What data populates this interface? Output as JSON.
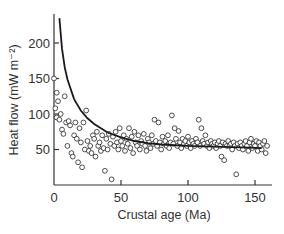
{
  "chart_data": {
    "type": "scatter",
    "title": "",
    "xlabel": "Crustal age (Ma)",
    "ylabel": "Heat flow (mW m⁻²)",
    "xlim": [
      0,
      162
    ],
    "ylim": [
      0,
      240
    ],
    "x_ticks": [
      0,
      50,
      100,
      150
    ],
    "y_ticks": [
      50,
      100,
      150,
      200
    ],
    "grid": false,
    "legend": null,
    "series": [
      {
        "name": "Observed heat flow",
        "style": "open-circle",
        "points": [
          [
            0,
            150
          ],
          [
            1,
            108
          ],
          [
            2,
            130
          ],
          [
            3,
            118
          ],
          [
            2,
            95
          ],
          [
            4,
            92
          ],
          [
            5,
            100
          ],
          [
            6,
            78
          ],
          [
            7,
            72
          ],
          [
            8,
            125
          ],
          [
            9,
            88
          ],
          [
            10,
            55
          ],
          [
            11,
            90
          ],
          [
            12,
            84
          ],
          [
            13,
            45
          ],
          [
            14,
            40
          ],
          [
            15,
            70
          ],
          [
            16,
            88
          ],
          [
            17,
            65
          ],
          [
            18,
            32
          ],
          [
            19,
            80
          ],
          [
            20,
            60
          ],
          [
            21,
            25
          ],
          [
            22,
            88
          ],
          [
            23,
            50
          ],
          [
            24,
            105
          ],
          [
            25,
            62
          ],
          [
            26,
            48
          ],
          [
            27,
            55
          ],
          [
            28,
            45
          ],
          [
            29,
            70
          ],
          [
            30,
            65
          ],
          [
            31,
            40
          ],
          [
            32,
            75
          ],
          [
            33,
            55
          ],
          [
            34,
            60
          ],
          [
            35,
            48
          ],
          [
            36,
            70
          ],
          [
            37,
            52
          ],
          [
            38,
            20
          ],
          [
            39,
            65
          ],
          [
            40,
            50
          ],
          [
            41,
            72
          ],
          [
            42,
            58
          ],
          [
            43,
            8
          ],
          [
            44,
            68
          ],
          [
            45,
            55
          ],
          [
            46,
            75
          ],
          [
            47,
            60
          ],
          [
            48,
            50
          ],
          [
            49,
            80
          ],
          [
            50,
            62
          ],
          [
            51,
            55
          ],
          [
            52,
            70
          ],
          [
            53,
            48
          ],
          [
            54,
            65
          ],
          [
            55,
            58
          ],
          [
            56,
            80
          ],
          [
            57,
            52
          ],
          [
            58,
            68
          ],
          [
            59,
            45
          ],
          [
            60,
            75
          ],
          [
            61,
            60
          ],
          [
            62,
            55
          ],
          [
            63,
            70
          ],
          [
            64,
            50
          ],
          [
            65,
            62
          ],
          [
            66,
            58
          ],
          [
            67,
            72
          ],
          [
            68,
            55
          ],
          [
            69,
            48
          ],
          [
            70,
            65
          ],
          [
            71,
            60
          ],
          [
            72,
            52
          ],
          [
            73,
            70
          ],
          [
            74,
            58
          ],
          [
            75,
            92
          ],
          [
            76,
            62
          ],
          [
            77,
            55
          ],
          [
            78,
            88
          ],
          [
            79,
            60
          ],
          [
            80,
            50
          ],
          [
            81,
            68
          ],
          [
            82,
            58
          ],
          [
            83,
            62
          ],
          [
            84,
            55
          ],
          [
            85,
            70
          ],
          [
            86,
            52
          ],
          [
            87,
            60
          ],
          [
            88,
            98
          ],
          [
            89,
            58
          ],
          [
            90,
            80
          ],
          [
            91,
            65
          ],
          [
            92,
            55
          ],
          [
            93,
            76
          ],
          [
            94,
            60
          ],
          [
            95,
            52
          ],
          [
            96,
            65
          ],
          [
            97,
            58
          ],
          [
            98,
            62
          ],
          [
            99,
            55
          ],
          [
            100,
            68
          ],
          [
            101,
            60
          ],
          [
            102,
            52
          ],
          [
            103,
            62
          ],
          [
            104,
            58
          ],
          [
            105,
            55
          ],
          [
            106,
            65
          ],
          [
            107,
            60
          ],
          [
            108,
            92
          ],
          [
            109,
            55
          ],
          [
            110,
            80
          ],
          [
            111,
            62
          ],
          [
            112,
            58
          ],
          [
            113,
            70
          ],
          [
            114,
            55
          ],
          [
            115,
            60
          ],
          [
            116,
            52
          ],
          [
            117,
            62
          ],
          [
            118,
            58
          ],
          [
            119,
            55
          ],
          [
            120,
            60
          ],
          [
            121,
            52
          ],
          [
            122,
            58
          ],
          [
            123,
            62
          ],
          [
            124,
            55
          ],
          [
            125,
            40
          ],
          [
            126,
            60
          ],
          [
            127,
            35
          ],
          [
            128,
            58
          ],
          [
            129,
            55
          ],
          [
            130,
            62
          ],
          [
            131,
            55
          ],
          [
            132,
            58
          ],
          [
            133,
            50
          ],
          [
            134,
            60
          ],
          [
            135,
            55
          ],
          [
            136,
            15
          ],
          [
            137,
            58
          ],
          [
            138,
            52
          ],
          [
            139,
            60
          ],
          [
            140,
            55
          ],
          [
            141,
            50
          ],
          [
            142,
            58
          ],
          [
            143,
            62
          ],
          [
            144,
            55
          ],
          [
            145,
            48
          ],
          [
            146,
            60
          ],
          [
            147,
            65
          ],
          [
            148,
            52
          ],
          [
            149,
            58
          ],
          [
            150,
            55
          ],
          [
            151,
            62
          ],
          [
            152,
            48
          ],
          [
            153,
            60
          ],
          [
            154,
            55
          ],
          [
            155,
            50
          ],
          [
            156,
            58
          ],
          [
            157,
            62
          ],
          [
            158,
            45
          ],
          [
            159,
            55
          ]
        ]
      },
      {
        "name": "Theoretical cooling curve",
        "style": "line",
        "points": [
          [
            4,
            235
          ],
          [
            6,
            192
          ],
          [
            8,
            166
          ],
          [
            10,
            149
          ],
          [
            15,
            121
          ],
          [
            20,
            105
          ],
          [
            25,
            94
          ],
          [
            30,
            86
          ],
          [
            40,
            74
          ],
          [
            50,
            67
          ],
          [
            60,
            62
          ],
          [
            70,
            59
          ],
          [
            80,
            57
          ],
          [
            100,
            55
          ],
          [
            120,
            54
          ],
          [
            140,
            53
          ],
          [
            155,
            52
          ]
        ]
      }
    ]
  }
}
